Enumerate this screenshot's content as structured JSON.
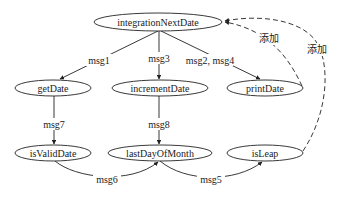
{
  "diagram": {
    "type": "call-graph",
    "nodes": [
      {
        "id": "integrationNextDate",
        "label": "integrationNextDate",
        "cx": 158,
        "cy": 22,
        "rx": 64,
        "ry": 9
      },
      {
        "id": "getDate",
        "label": "getDate",
        "cx": 53,
        "cy": 88,
        "rx": 38,
        "ry": 8
      },
      {
        "id": "incrementDate",
        "label": "incrementDate",
        "cx": 160,
        "cy": 88,
        "rx": 48,
        "ry": 8
      },
      {
        "id": "printDate",
        "label": "printDate",
        "cx": 265,
        "cy": 88,
        "rx": 38,
        "ry": 8
      },
      {
        "id": "isValidDate",
        "label": "isValidDate",
        "cx": 53,
        "cy": 153,
        "rx": 38,
        "ry": 8
      },
      {
        "id": "lastDayOfMonth",
        "label": "lastDayOfMonth",
        "cx": 160,
        "cy": 153,
        "rx": 52,
        "ry": 8
      },
      {
        "id": "isLeap",
        "label": "isLeap",
        "cx": 265,
        "cy": 153,
        "rx": 38,
        "ry": 8
      }
    ],
    "edges": [
      {
        "from": "integrationNextDate",
        "to": "getDate",
        "label": "msg1",
        "style": "solid"
      },
      {
        "from": "integrationNextDate",
        "to": "incrementDate",
        "label": "msg3",
        "style": "solid"
      },
      {
        "from": "integrationNextDate",
        "to": "printDate",
        "label": "msg2, msg4",
        "style": "solid"
      },
      {
        "from": "getDate",
        "to": "isValidDate",
        "label": "msg7",
        "style": "solid"
      },
      {
        "from": "incrementDate",
        "to": "lastDayOfMonth",
        "label": "msg8",
        "style": "solid"
      },
      {
        "from": "isValidDate",
        "to": "lastDayOfMonth",
        "label": "msg6",
        "style": "solid"
      },
      {
        "from": "lastDayOfMonth",
        "to": "isLeap",
        "label": "msg5",
        "style": "solid"
      },
      {
        "from": "printDate",
        "to": "integrationNextDate",
        "label": "添加",
        "style": "dashed"
      },
      {
        "from": "isLeap",
        "to": "integrationNextDate",
        "label": "添加",
        "style": "dashed"
      }
    ],
    "colors": {
      "stroke": "#222222",
      "background": "#ffffff"
    }
  },
  "labels": {
    "n0": "integrationNextDate",
    "n1": "getDate",
    "n2": "incrementDate",
    "n3": "printDate",
    "n4": "isValidDate",
    "n5": "lastDayOfMonth",
    "n6": "isLeap",
    "e_msg1": "msg1",
    "e_msg3": "msg3",
    "e_msg24": "msg2, msg4",
    "e_msg7": "msg7",
    "e_msg8": "msg8",
    "e_msg6": "msg6",
    "e_msg5": "msg5",
    "e_add1": "添加",
    "e_add2": "添加"
  }
}
